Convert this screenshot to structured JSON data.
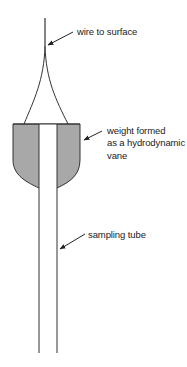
{
  "diagram": {
    "labels": {
      "wire": "wire to surface",
      "weight_line1": "weight formed",
      "weight_line2": "as a hydrodynamic",
      "weight_line3": "vane",
      "tube": "sampling tube"
    },
    "colors": {
      "stroke": "#333333",
      "weight_fill": "#a8a8a8",
      "tube_fill": "#ffffff",
      "text": "#222222"
    }
  }
}
